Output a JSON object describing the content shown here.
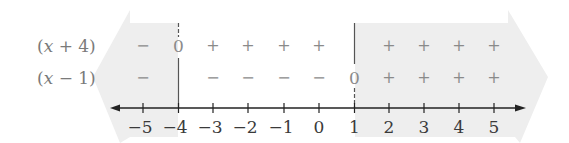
{
  "diagram": {
    "type": "sign-chart-number-line",
    "rows": [
      {
        "label_prefix": "(",
        "label_var": "x",
        "label_suffix": " + 4)",
        "signs": [
          "−",
          "0",
          "+",
          "+",
          "+",
          "+",
          "",
          "+",
          "+",
          "+",
          "+"
        ]
      },
      {
        "label_prefix": "(",
        "label_var": "x",
        "label_suffix": " − 1)",
        "signs": [
          "−",
          "",
          "−",
          "−",
          "−",
          "−",
          "0",
          "+",
          "+",
          "+",
          "+"
        ]
      }
    ],
    "axis": {
      "ticks": [
        "−5",
        "−4",
        "−3",
        "−2",
        "−1",
        "0",
        "1",
        "2",
        "3",
        "4",
        "5"
      ],
      "tick_values": [
        -5,
        -4,
        -3,
        -2,
        -1,
        0,
        1,
        2,
        3,
        4,
        5
      ]
    },
    "critical_points": [
      -4,
      1
    ],
    "shaded_regions": [
      {
        "from": "-infinity",
        "to": -4,
        "direction": "left"
      },
      {
        "from": 1,
        "to": "infinity",
        "direction": "right"
      }
    ],
    "colors": {
      "shade": "#eeeeee",
      "axis": "#222222",
      "signs": "#8a8a8a",
      "labels": "#7a7a7a"
    }
  }
}
